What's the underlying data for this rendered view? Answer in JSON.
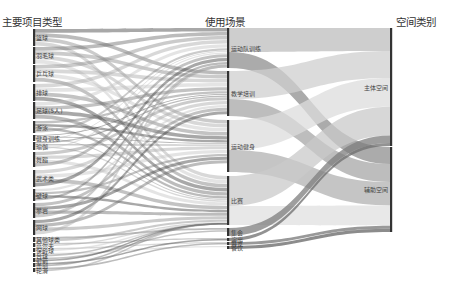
{
  "columns": [
    {
      "title": "主要项目类型",
      "x": 33
    },
    {
      "title": "使用场景",
      "x": 228
    },
    {
      "title": "空间类别",
      "x": 390
    }
  ],
  "colors": {
    "axis": "#333333",
    "flow_dark": "#555555",
    "flow_light": "#bbbbbb",
    "background": "#ffffff"
  },
  "left_nodes": [
    {
      "label": "篮球",
      "y0": 29,
      "y1": 46
    },
    {
      "label": "羽毛球",
      "y0": 47,
      "y1": 64
    },
    {
      "label": "乒乓球",
      "y0": 65,
      "y1": 82
    },
    {
      "label": "排球",
      "y0": 84,
      "y1": 101
    },
    {
      "label": "足球(5人)",
      "y0": 102,
      "y1": 119
    },
    {
      "label": "游泳",
      "y0": 121,
      "y1": 133
    },
    {
      "label": "健身训练",
      "y0": 135,
      "y1": 141
    },
    {
      "label": "瑜伽",
      "y0": 142,
      "y1": 150
    },
    {
      "label": "舞蹈",
      "y0": 152,
      "y1": 167
    },
    {
      "label": "武术类",
      "y0": 170,
      "y1": 187
    },
    {
      "label": "壁球",
      "y0": 189,
      "y1": 201
    },
    {
      "label": "攀岩",
      "y0": 203,
      "y1": 218
    },
    {
      "label": "网球",
      "y0": 220,
      "y1": 235
    },
    {
      "label": "其他球类",
      "y0": 237,
      "y1": 242
    },
    {
      "label": "高尔夫",
      "y0": 243,
      "y1": 247
    },
    {
      "label": "保龄球",
      "y0": 248,
      "y1": 252
    },
    {
      "label": "台球",
      "y0": 253,
      "y1": 257
    },
    {
      "label": "射箭",
      "y0": 258,
      "y1": 262
    },
    {
      "label": "击剑",
      "y0": 263,
      "y1": 267
    },
    {
      "label": "轮滑",
      "y0": 268,
      "y1": 272
    }
  ],
  "middle_nodes": [
    {
      "label": "运动队训练",
      "y0": 28,
      "y1": 68
    },
    {
      "label": "教学培训",
      "y0": 71,
      "y1": 116
    },
    {
      "label": "运动健身",
      "y0": 120,
      "y1": 172
    },
    {
      "label": "比赛",
      "y0": 176,
      "y1": 225
    },
    {
      "label": "集会",
      "y0": 228,
      "y1": 236
    },
    {
      "label": "演出",
      "y0": 238,
      "y1": 241
    },
    {
      "label": "展览",
      "y0": 242,
      "y1": 245
    },
    {
      "label": "餐饮",
      "y0": 246,
      "y1": 249
    }
  ],
  "right_nodes": [
    {
      "label": "主体空间",
      "y0": 28,
      "y1": 146
    },
    {
      "label": "辅助空间",
      "y0": 147,
      "y1": 232
    }
  ],
  "links_mid_right": [
    {
      "source": 0,
      "target": 0,
      "width": 24,
      "shade": "#bdbdbd"
    },
    {
      "source": 0,
      "target": 1,
      "width": 16,
      "shade": "#8f8f8f"
    },
    {
      "source": 1,
      "target": 0,
      "width": 28,
      "shade": "#cfcfcf"
    },
    {
      "source": 1,
      "target": 1,
      "width": 17,
      "shade": "#a7a7a7"
    },
    {
      "source": 2,
      "target": 0,
      "width": 30,
      "shade": "#dcdcdc"
    },
    {
      "source": 2,
      "target": 1,
      "width": 22,
      "shade": "#b2b2b2"
    },
    {
      "source": 3,
      "target": 0,
      "width": 30,
      "shade": "#c9c9c9"
    },
    {
      "source": 3,
      "target": 1,
      "width": 19,
      "shade": "#e0e0e0"
    },
    {
      "source": 4,
      "target": 0,
      "width": 8,
      "shade": "#7d7d7d"
    },
    {
      "source": 5,
      "target": 0,
      "width": 3,
      "shade": "#6e6e6e"
    },
    {
      "source": 6,
      "target": 1,
      "width": 3,
      "shade": "#777777"
    },
    {
      "source": 7,
      "target": 1,
      "width": 3,
      "shade": "#666666"
    }
  ]
}
